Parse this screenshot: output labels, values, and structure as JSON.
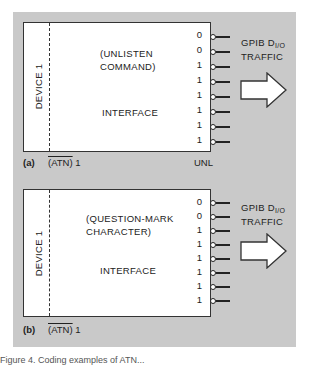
{
  "panels": [
    {
      "id": "a",
      "label": "(a)",
      "device_label": "DEVICE 1",
      "title_line1": "(UNLISTEN",
      "title_line2": "COMMAND)",
      "interface_label": "INTERFACE",
      "bits": [
        "0",
        "0",
        "1",
        "1",
        "1",
        "1",
        "1",
        "1"
      ],
      "traffic_line1": "GPIB D",
      "traffic_sub": "I/O",
      "traffic_line2": "TRAFFIC",
      "atn_label": "(ATN)",
      "atn_value": "1",
      "command_label": "UNL"
    },
    {
      "id": "b",
      "label": "(b)",
      "device_label": "DEVICE 1",
      "title_line1": "(QUESTION-MARK",
      "title_line2": "CHARACTER)",
      "interface_label": "INTERFACE",
      "bits": [
        "0",
        "0",
        "1",
        "1",
        "1",
        "1",
        "1",
        "1"
      ],
      "traffic_line1": "GPIB D",
      "traffic_sub": "I/O",
      "traffic_line2": "TRAFFIC",
      "atn_label": "(ATN)",
      "atn_value": "1"
    }
  ],
  "caption": "Figure 4. Coding examples of ATN..."
}
